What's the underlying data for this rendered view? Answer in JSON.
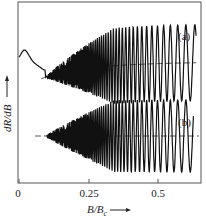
{
  "chart_data": {
    "type": "line",
    "title": "",
    "xlabel": "B/B_c",
    "xlabel_main": "B/B",
    "xlabel_sub": "c",
    "ylabel": "dR/dB",
    "xlim": [
      0,
      0.62
    ],
    "xticks": [
      {
        "value": 0,
        "label": "0"
      },
      {
        "value": 0.25,
        "label": "0.25"
      },
      {
        "value": 0.5,
        "label": "0.5"
      }
    ],
    "grid": false,
    "legend": "none",
    "annotations": [
      "(a)",
      "(b)"
    ],
    "series": [
      {
        "name": "(a)",
        "description": "Quantum oscillations of dR/dB with sloping background; oscillation amplitude grows with B",
        "peak_positions": [
          0.11,
          0.13,
          0.15,
          0.18,
          0.21,
          0.26,
          0.33,
          0.5
        ],
        "trough_positions": [
          0.12,
          0.14,
          0.165,
          0.195,
          0.23,
          0.29,
          0.41,
          0.62
        ],
        "background": "dashed curve rising from left, flattening near the right",
        "style": "solid"
      },
      {
        "name": "(b)",
        "description": "Same oscillations with background subtracted; centered on horizontal dashed baseline",
        "peak_positions": [
          0.11,
          0.13,
          0.15,
          0.18,
          0.21,
          0.26,
          0.33,
          0.5
        ],
        "trough_positions": [
          0.12,
          0.14,
          0.165,
          0.195,
          0.23,
          0.29,
          0.41,
          0.6
        ],
        "background": "horizontal dashed baseline",
        "style": "solid"
      }
    ]
  },
  "labels": {
    "series_a": "(a)",
    "series_b": "(b)",
    "tick_0": "0",
    "tick_025": "0.25",
    "tick_05": "0.5",
    "xlabel_main": "B/B",
    "xlabel_sub": "c",
    "ylabel": "dR/dB"
  }
}
